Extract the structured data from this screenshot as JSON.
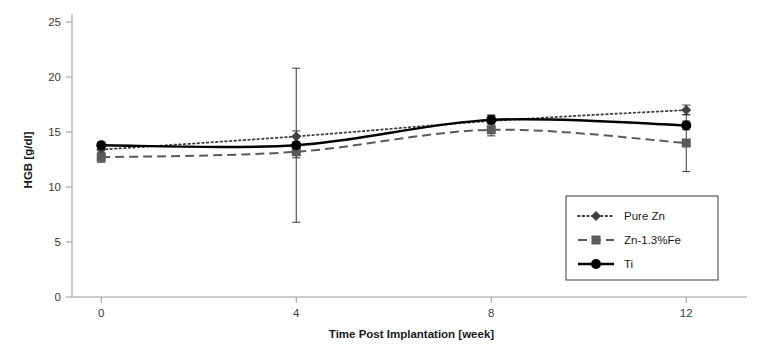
{
  "chart_data": {
    "type": "line",
    "title": "",
    "xlabel": "Time Post Implantation [week]",
    "ylabel": "HGB [g/dl]",
    "x": [
      0,
      4,
      8,
      12
    ],
    "xticks": [
      "0",
      "4",
      "8",
      "12"
    ],
    "yticks": [
      "0",
      "5",
      "10",
      "15",
      "20",
      "25"
    ],
    "xlim": [
      -0.6,
      13.0
    ],
    "ylim": [
      0,
      25
    ],
    "grid": false,
    "legend_position": "bottom-right",
    "series": [
      {
        "name": "Pure Zn",
        "marker": "diamond",
        "linestyle": "dotted",
        "color": "#404040",
        "values": [
          13.4,
          14.6,
          16.0,
          17.0
        ],
        "errors": [
          0.35,
          0.5,
          0.5,
          0.45
        ]
      },
      {
        "name": "Zn-1.3%Fe",
        "marker": "square",
        "linestyle": "dashed",
        "color": "#5a5a5a",
        "values": [
          12.7,
          13.2,
          15.2,
          14.0
        ],
        "errors": [
          0.45,
          0.55,
          0.55,
          2.6
        ]
      },
      {
        "name": "Ti",
        "marker": "circle",
        "linestyle": "solid",
        "color": "#000000",
        "values": [
          13.8,
          13.8,
          16.1,
          15.6
        ],
        "errors": [
          0.3,
          7.0,
          0.45,
          0.4
        ]
      }
    ]
  }
}
